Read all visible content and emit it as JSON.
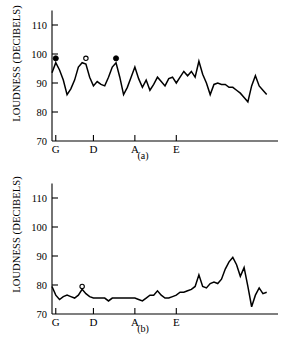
{
  "figure": {
    "panels": [
      {
        "id": "a",
        "caption": "(a)",
        "ylabel": "LOUDNESS (DECIBELS)"
      },
      {
        "id": "b",
        "caption": "(b)",
        "ylabel": "LOUDNESS (DECIBELS)"
      }
    ],
    "colors": {
      "ink": "#000000",
      "background": "#ffffff"
    }
  },
  "chart_data": [
    {
      "type": "line",
      "panel": "(a)",
      "title": "",
      "xlabel": "",
      "ylabel": "LOUDNESS (DECIBELS)",
      "ylim": [
        70,
        115
      ],
      "yticks": [
        70,
        80,
        90,
        100,
        110
      ],
      "yticklabels": [
        "70",
        "80",
        "90",
        "100",
        "110"
      ],
      "xlim": [
        0,
        60
      ],
      "xticks": [
        1,
        11,
        22,
        33
      ],
      "xticklabels": [
        "G",
        "D",
        "A",
        "E"
      ],
      "grid": false,
      "legend": null,
      "x": [
        0,
        1,
        2,
        3,
        4,
        5,
        6,
        7,
        8,
        9,
        10,
        11,
        12,
        13,
        14,
        15,
        16,
        17,
        18,
        19,
        20,
        21,
        22,
        23,
        24,
        25,
        26,
        27,
        28,
        29,
        30,
        31,
        32,
        33,
        34,
        35,
        36,
        37,
        38,
        39,
        40,
        41,
        42,
        43,
        44,
        45,
        46,
        47,
        48,
        49,
        50,
        51,
        52,
        53,
        54,
        55,
        56,
        57
      ],
      "values": [
        93.5,
        97.0,
        94.5,
        91.0,
        86.0,
        88.0,
        91.0,
        95.5,
        97.0,
        96.5,
        92.0,
        89.0,
        90.5,
        89.5,
        89.0,
        92.0,
        95.5,
        97.0,
        92.0,
        86.0,
        88.5,
        92.0,
        95.5,
        91.5,
        88.5,
        91.0,
        87.5,
        89.5,
        92.0,
        90.5,
        89.0,
        91.5,
        92.0,
        90.0,
        92.0,
        94.0,
        92.5,
        94.0,
        92.0,
        97.5,
        93.0,
        90.0,
        86.0,
        89.5,
        90.0,
        89.5,
        89.5,
        88.5,
        88.5,
        87.5,
        86.5,
        85.0,
        83.5,
        89.0,
        92.5,
        89.0,
        87.5,
        86.0
      ],
      "markers": [
        {
          "x": 1,
          "y": 98.5,
          "style": "filled-circle",
          "label": "G"
        },
        {
          "x": 9,
          "y": 98.5,
          "style": "open-circle",
          "label": "D"
        },
        {
          "x": 17,
          "y": 98.5,
          "style": "filled-circle",
          "label": "A"
        }
      ]
    },
    {
      "type": "line",
      "panel": "(b)",
      "title": "",
      "xlabel": "",
      "ylabel": "LOUDNESS (DECIBELS)",
      "ylim": [
        70,
        115
      ],
      "yticks": [
        70,
        80,
        90,
        100,
        110
      ],
      "yticklabels": [
        "70",
        "80",
        "90",
        "100",
        "110"
      ],
      "xlim": [
        0,
        60
      ],
      "xticks": [
        1,
        11,
        22,
        33
      ],
      "xticklabels": [
        "G",
        "D",
        "A",
        "E"
      ],
      "grid": false,
      "legend": null,
      "x": [
        0,
        1,
        2,
        3,
        4,
        5,
        6,
        7,
        8,
        9,
        10,
        11,
        12,
        13,
        14,
        15,
        16,
        17,
        18,
        19,
        20,
        21,
        22,
        23,
        24,
        25,
        26,
        27,
        28,
        29,
        30,
        31,
        32,
        33,
        34,
        35,
        36,
        37,
        38,
        39,
        40,
        41,
        42,
        43,
        44,
        45,
        46,
        47,
        48,
        49,
        50,
        51,
        52,
        53,
        54,
        55,
        56,
        57
      ],
      "values": [
        79.5,
        76.5,
        75.0,
        76.0,
        76.5,
        76.0,
        75.5,
        76.5,
        78.5,
        77.0,
        76.0,
        75.5,
        75.5,
        75.5,
        75.5,
        74.5,
        75.5,
        75.5,
        75.5,
        75.5,
        75.5,
        75.5,
        75.5,
        75.0,
        74.5,
        75.5,
        76.5,
        76.5,
        78.0,
        76.5,
        75.5,
        75.5,
        76.0,
        76.5,
        77.5,
        77.5,
        78.0,
        78.5,
        79.5,
        83.5,
        79.5,
        79.0,
        80.5,
        81.0,
        80.5,
        82.0,
        85.5,
        88.0,
        89.5,
        87.0,
        83.0,
        86.0,
        79.5,
        72.5,
        76.5,
        79.0,
        77.0,
        77.5
      ],
      "markers": [
        {
          "x": 8,
          "y": 79.5,
          "style": "open-circle",
          "label": "D"
        }
      ]
    }
  ]
}
